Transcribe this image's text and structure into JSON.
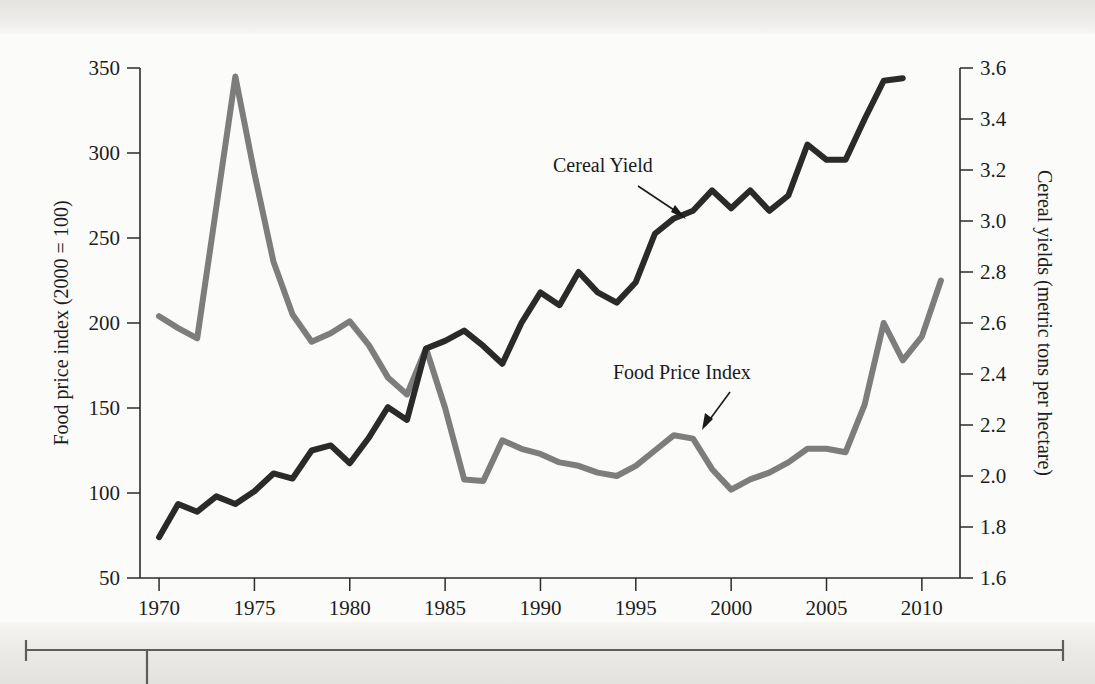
{
  "figure": {
    "background_color": "#fbfbfa",
    "page_color": "#eceae7"
  },
  "chart_data": {
    "type": "line",
    "title": "",
    "xlabel": "",
    "x": [
      1970,
      1971,
      1972,
      1973,
      1974,
      1975,
      1976,
      1977,
      1978,
      1979,
      1980,
      1981,
      1982,
      1983,
      1984,
      1985,
      1986,
      1987,
      1988,
      1989,
      1990,
      1991,
      1992,
      1993,
      1994,
      1995,
      1996,
      1997,
      1998,
      1999,
      2000,
      2001,
      2002,
      2003,
      2004,
      2005,
      2006,
      2007,
      2008,
      2009,
      2010,
      2011
    ],
    "xlim": [
      1969,
      2012
    ],
    "xticks": [
      1970,
      1975,
      1980,
      1985,
      1990,
      1995,
      2000,
      2005,
      2010
    ],
    "xticklabels": [
      "1970",
      "1975",
      "1980",
      "1985",
      "1990",
      "1995",
      "2000",
      "2005",
      "2010"
    ],
    "grid": false,
    "legend_position": "inline-annotations",
    "left_axis": {
      "label": "Food price index (2000 = 100)",
      "ylim": [
        50,
        350
      ],
      "ticks": [
        50,
        100,
        150,
        200,
        250,
        300,
        350
      ],
      "ticklabels": [
        "50",
        "100",
        "150",
        "200",
        "250",
        "300",
        "350"
      ]
    },
    "right_axis": {
      "label": "Cereal yields (metric tons per hectare)",
      "ylim": [
        1.6,
        3.6
      ],
      "ticks": [
        1.6,
        1.8,
        2.0,
        2.2,
        2.4,
        2.6,
        2.8,
        3.0,
        3.2,
        3.4,
        3.6
      ],
      "ticklabels": [
        "1.6",
        "1.8",
        "2.0",
        "2.2",
        "2.4",
        "2.6",
        "2.8",
        "3.0",
        "3.2",
        "3.4",
        "3.6"
      ]
    },
    "series": [
      {
        "name": "Food Price Index",
        "axis": "left",
        "color": "#7d7d7d",
        "stroke_width": 6,
        "units": "index (2000 = 100)",
        "x": [
          1970,
          1971,
          1972,
          1973,
          1974,
          1975,
          1976,
          1977,
          1978,
          1979,
          1980,
          1981,
          1982,
          1983,
          1984,
          1985,
          1986,
          1987,
          1988,
          1989,
          1990,
          1991,
          1992,
          1993,
          1994,
          1995,
          1996,
          1997,
          1998,
          1999,
          2000,
          2001,
          2002,
          2003,
          2004,
          2005,
          2006,
          2007,
          2008,
          2009,
          2010,
          2011
        ],
        "values": [
          204,
          197,
          191,
          268,
          345,
          288,
          236,
          205,
          189,
          194,
          201,
          187,
          168,
          158,
          185,
          150,
          108,
          107,
          131,
          126,
          123,
          118,
          116,
          112,
          110,
          116,
          125,
          134,
          132,
          114,
          102,
          108,
          112,
          118,
          126,
          126,
          124,
          152,
          200,
          178,
          192,
          225
        ]
      },
      {
        "name": "Cereal Yield",
        "axis": "right",
        "color": "#2a2a2a",
        "stroke_width": 6,
        "units": "metric tons per hectare",
        "x": [
          1970,
          1971,
          1972,
          1973,
          1974,
          1975,
          1976,
          1977,
          1978,
          1979,
          1980,
          1981,
          1982,
          1983,
          1984,
          1985,
          1986,
          1987,
          1988,
          1989,
          1990,
          1991,
          1992,
          1993,
          1994,
          1995,
          1996,
          1997,
          1998,
          1999,
          2000,
          2001,
          2002,
          2003,
          2004,
          2005,
          2006,
          2007,
          2008,
          2009
        ],
        "values": [
          1.76,
          1.89,
          1.86,
          1.92,
          1.89,
          1.94,
          2.01,
          1.99,
          2.1,
          2.12,
          2.05,
          2.15,
          2.27,
          2.22,
          2.5,
          2.53,
          2.57,
          2.51,
          2.44,
          2.6,
          2.72,
          2.67,
          2.8,
          2.72,
          2.68,
          2.76,
          2.95,
          3.01,
          3.04,
          3.12,
          3.05,
          3.12,
          3.04,
          3.1,
          3.3,
          3.24,
          3.24,
          3.4,
          3.55,
          3.56
        ]
      }
    ],
    "annotations": [
      {
        "text": "Cereal Yield",
        "series": "Cereal Yield"
      },
      {
        "text": "Food Price Index",
        "series": "Food Price Index"
      }
    ]
  }
}
